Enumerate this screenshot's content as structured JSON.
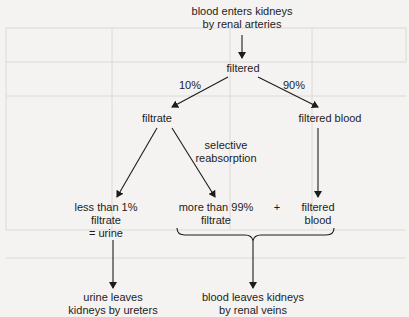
{
  "diagram": {
    "nodes": {
      "start": {
        "line1": "blood enters kidneys",
        "line2": "by renal arteries"
      },
      "filtered": {
        "label": "filtered"
      },
      "split_left_pct": "10%",
      "split_right_pct": "90%",
      "filtrate": {
        "label": "filtrate"
      },
      "filtered_blood": {
        "label": "filtered blood"
      },
      "reabsorption": {
        "line1": "selective",
        "line2": "reabsorption"
      },
      "urine_portion": {
        "line1": "less than 1%",
        "line2": "filtrate",
        "line3": "= urine"
      },
      "reabsorbed_portion": {
        "line1": "more than 99%",
        "line2": "filtrate"
      },
      "plus": "+",
      "filtered_blood_2": {
        "line1": "filtered",
        "line2": "blood"
      },
      "urine_exit": {
        "line1": "urine leaves",
        "line2": "kidneys by ureters"
      },
      "blood_exit": {
        "line1": "blood leaves kidneys",
        "line2": "by renal veins"
      }
    },
    "colors": {
      "ink": "#1c1c1c",
      "paper": "#f4f3f1",
      "bleed_through": "#d6d4d0"
    }
  }
}
